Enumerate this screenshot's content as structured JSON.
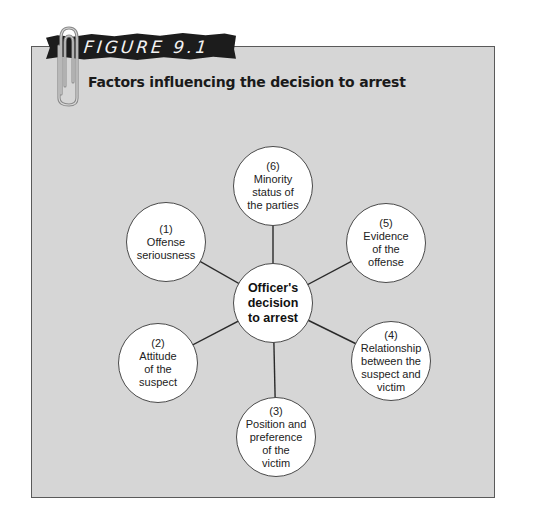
{
  "figure": {
    "label": "FIGURE 9.1",
    "title": "Factors influencing the decision to arrest"
  },
  "colors": {
    "panel_bg": "#d6d6d6",
    "panel_border": "#5a5a5a",
    "banner_bg": "#1c1c1c",
    "node_bg": "#ffffff",
    "connector": "#2a2a2a"
  },
  "diagram": {
    "center": {
      "lines": [
        "Officer's",
        "decision",
        "to arrest"
      ],
      "cx": 273,
      "cy": 303
    },
    "factors": [
      {
        "number": "(1)",
        "lines": [
          "Offense",
          "seriousness"
        ],
        "cx": 166,
        "cy": 242
      },
      {
        "number": "(2)",
        "lines": [
          "Attitude",
          "of the",
          "suspect"
        ],
        "cx": 158,
        "cy": 363
      },
      {
        "number": "(3)",
        "lines": [
          "Position and",
          "preference",
          "of the",
          "victim"
        ],
        "cx": 276,
        "cy": 437
      },
      {
        "number": "(4)",
        "lines": [
          "Relationship",
          "between the",
          "suspect and",
          "victim"
        ],
        "cx": 391,
        "cy": 361
      },
      {
        "number": "(5)",
        "lines": [
          "Evidence",
          "of the",
          "offense"
        ],
        "cx": 386,
        "cy": 243
      },
      {
        "number": "(6)",
        "lines": [
          "Minority",
          "status of",
          "the parties"
        ],
        "cx": 273,
        "cy": 186
      }
    ]
  }
}
